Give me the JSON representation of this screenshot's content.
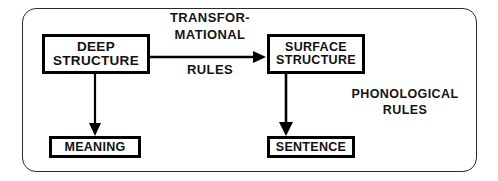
{
  "diagram": {
    "frame": {
      "shape": "rounded-rectangle",
      "stroke": "#2a2a2a"
    },
    "boxes": [
      {
        "id": "deep-structure",
        "lines": [
          "DEEP",
          "STRUCTURE"
        ]
      },
      {
        "id": "surface-structure",
        "lines": [
          "SURFACE",
          "STRUCTURE"
        ]
      },
      {
        "id": "meaning",
        "lines": [
          "MEANING"
        ]
      },
      {
        "id": "sentence",
        "lines": [
          "SENTENCE"
        ]
      }
    ],
    "labels": {
      "transformational_rules": {
        "line1": "TRANSFOR-",
        "line2": "MATIONAL",
        "line3": "RULES"
      },
      "phonological_rules": {
        "line1": "PHONOLOGICAL",
        "line2": "RULES"
      }
    },
    "arrows": [
      {
        "id": "deep-to-surface",
        "direction": "right",
        "from": "deep-structure",
        "to": "surface-structure"
      },
      {
        "id": "deep-to-meaning",
        "direction": "down",
        "from": "deep-structure",
        "to": "meaning"
      },
      {
        "id": "surface-to-sentence",
        "direction": "down",
        "from": "surface-structure",
        "to": "sentence"
      }
    ],
    "colors": {
      "background": "#ffffff",
      "ink": "#000000",
      "frame_stroke": "#2a2a2a",
      "text": "#141414"
    }
  }
}
